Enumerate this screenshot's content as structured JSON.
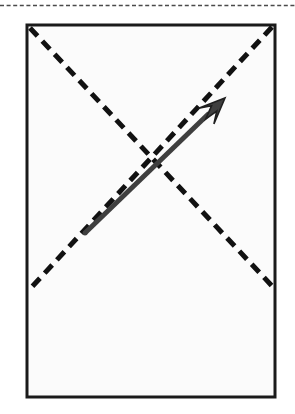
{
  "figure": {
    "kind": "geometry-diagram",
    "width": 295,
    "height": 414,
    "background_color": "#ffffff",
    "caption": "",
    "title": ""
  },
  "top_rule": {
    "name": "top-dashed-separator",
    "y": 5.5,
    "x_start": 0,
    "x_end": 295,
    "color": "#4a4a4a",
    "stroke_width": 1.6,
    "dash_length": 4,
    "gap_length": 2.6
  },
  "rectangle": {
    "name": "page-outline-rectangle",
    "x": 27,
    "y": 25,
    "width": 248,
    "height": 372,
    "stroke_color": "#1a1a1a",
    "stroke_width": 3,
    "fill_color": "#fbfbfb",
    "corners": {
      "top_left": [
        27,
        25
      ],
      "top_right": [
        275,
        25
      ],
      "bottom_right": [
        275,
        397
      ],
      "bottom_left": [
        27,
        397
      ]
    }
  },
  "diagonals": [
    {
      "name": "main-diagonal-dashed",
      "from": [
        30,
        28
      ],
      "to": [
        273,
        287
      ],
      "color": "#111111",
      "stroke_width": 5,
      "dash_length": 11,
      "gap_length": 7,
      "direction": "top-left-to-bottom-right"
    },
    {
      "name": "anti-diagonal-dashed",
      "from": [
        272,
        27
      ],
      "to": [
        30,
        289
      ],
      "color": "#111111",
      "stroke_width": 5,
      "dash_length": 11,
      "gap_length": 7,
      "direction": "top-right-to-bottom-left"
    }
  ],
  "arrow": {
    "name": "direction-arrow",
    "tail": [
      85,
      233
    ],
    "tip": [
      225,
      98
    ],
    "shaft_color": "#3f3f3f",
    "outline_color": "#1f1f1f",
    "shaft_width": 5,
    "head_length": 26,
    "head_half_width": 11,
    "label": ""
  },
  "annotations": {
    "labels": []
  }
}
